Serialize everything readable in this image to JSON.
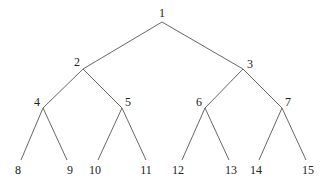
{
  "diagram": {
    "type": "binary-tree",
    "nodes": [
      {
        "id": 1,
        "label": "1"
      },
      {
        "id": 2,
        "label": "2"
      },
      {
        "id": 3,
        "label": "3"
      },
      {
        "id": 4,
        "label": "4"
      },
      {
        "id": 5,
        "label": "5"
      },
      {
        "id": 6,
        "label": "6"
      },
      {
        "id": 7,
        "label": "7"
      },
      {
        "id": 8,
        "label": "8"
      },
      {
        "id": 9,
        "label": "9"
      },
      {
        "id": 10,
        "label": "10"
      },
      {
        "id": 11,
        "label": "11"
      },
      {
        "id": 12,
        "label": "12"
      },
      {
        "id": 13,
        "label": "13"
      },
      {
        "id": 14,
        "label": "14"
      },
      {
        "id": 15,
        "label": "15"
      }
    ],
    "edges": [
      [
        1,
        2
      ],
      [
        1,
        3
      ],
      [
        2,
        4
      ],
      [
        2,
        5
      ],
      [
        3,
        6
      ],
      [
        3,
        7
      ],
      [
        4,
        8
      ],
      [
        4,
        9
      ],
      [
        5,
        10
      ],
      [
        5,
        11
      ],
      [
        6,
        12
      ],
      [
        6,
        13
      ],
      [
        7,
        14
      ],
      [
        7,
        15
      ]
    ]
  }
}
